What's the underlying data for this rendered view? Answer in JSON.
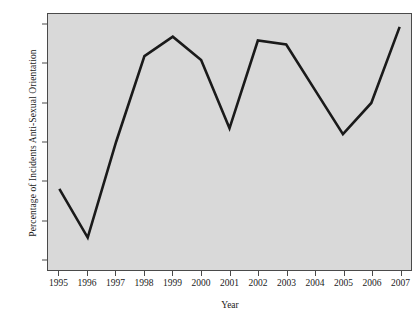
{
  "chart_data": {
    "type": "line",
    "title": "",
    "xlabel": "Year",
    "ylabel": "Percentage of Incidents Anti-Sexual Orientation",
    "x": [
      1995,
      1996,
      1997,
      1998,
      1999,
      2000,
      2001,
      2002,
      2003,
      2004,
      2005,
      2006,
      2007
    ],
    "categories": [
      "1995",
      "1996",
      "1997",
      "1998",
      "1999",
      "2000",
      "2001",
      "2002",
      "2003",
      "2004",
      "2005",
      "2006",
      "2007"
    ],
    "values": [
      12.8,
      11.55,
      14.0,
      16.2,
      16.7,
      16.1,
      14.35,
      16.6,
      16.5,
      15.35,
      14.2,
      15.0,
      16.95
    ],
    "series": [
      {
        "name": "Percentage of Incidents Anti-Sexual Orientation",
        "values": [
          12.8,
          11.55,
          14.0,
          16.2,
          16.7,
          16.1,
          14.35,
          16.6,
          16.5,
          15.35,
          14.2,
          15.0,
          16.95
        ]
      }
    ],
    "xlim": [
      1994.6,
      2007.4
    ],
    "ylim": [
      10.72,
      17.28
    ],
    "yticks": [
      11,
      12,
      13,
      14,
      15,
      16,
      17
    ],
    "ytick_labels": [
      "11",
      "12",
      "13",
      "14",
      "15",
      "16",
      "17"
    ],
    "xticks": [
      1995,
      1996,
      1997,
      1998,
      1999,
      2000,
      2001,
      2002,
      2003,
      2004,
      2005,
      2006,
      2007
    ],
    "grid": false,
    "legend": "none",
    "line_color": "#1a1a1a",
    "line_width": 2.6,
    "plot_background": "#d9d9d9",
    "figure_background": "#ffffff",
    "frame_color": "#4a4a4a",
    "text_color": "#1a1a1a"
  }
}
